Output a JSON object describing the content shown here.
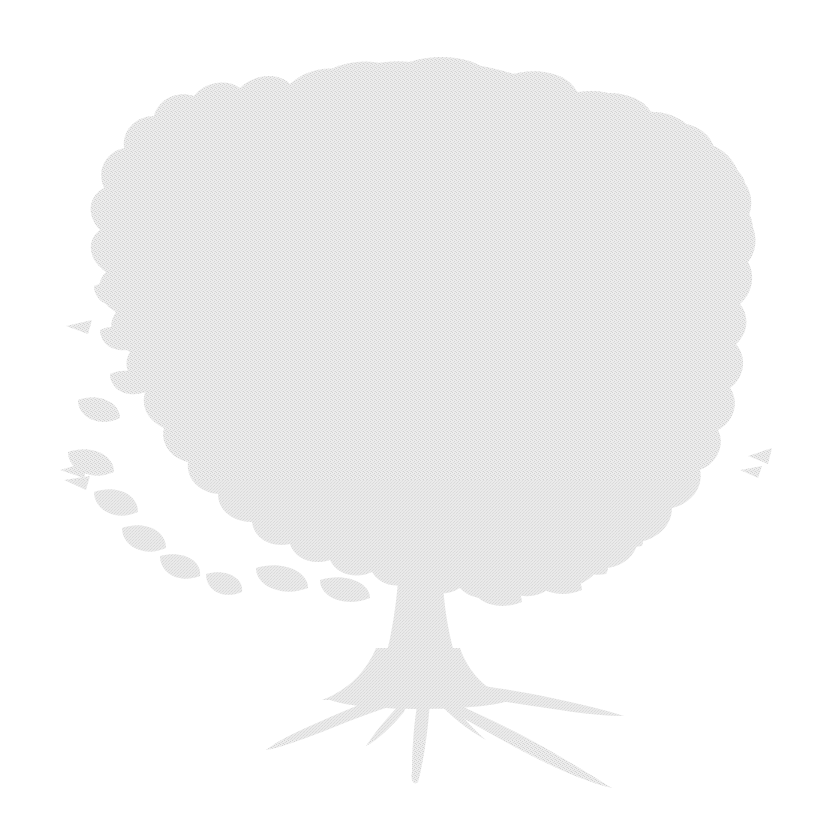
{
  "image": {
    "kind": "natural-image",
    "subject": "tree-silhouette",
    "description": "Faint light-grey silhouette of a broad deciduous oak tree with spreading canopy, short trunk and flaring surface roots, rendered as a dithered halftone texture on a plain white background.",
    "alt_text": "Pale grey watermark-style silhouette of a broad-canopied oak tree",
    "width_px": 814,
    "height_px": 835,
    "orientation": "portrait",
    "has_text": false,
    "text_content": "",
    "background_color": "#ffffff",
    "silhouette_color": "#e4e4e4",
    "silhouette_color_dark_dither": "#d6d6d6",
    "silhouette_color_light_dither": "#f2f2f2",
    "texture": "fine checkerboard dither / halftone stipple",
    "opacity": "very light, watermark-like"
  },
  "geometry": {
    "canopy": {
      "label": "canopy",
      "left_px": 65,
      "right_px": 757,
      "top_px": 60,
      "bottom_px": 625,
      "center_x_px": 411,
      "center_y_px": 340,
      "shape": "irregular ragged lobed mass"
    },
    "trunk": {
      "label": "trunk",
      "top_px": 520,
      "bottom_px": 700,
      "top_width_px": 46,
      "bottom_width_px": 120,
      "center_x_px": 421
    },
    "roots": {
      "label": "roots",
      "base_y_px": 690,
      "lowest_y_px": 788,
      "left_tip_x_px": 266,
      "right_tip_x_px": 624,
      "count": 4
    }
  },
  "chart_data": null
}
